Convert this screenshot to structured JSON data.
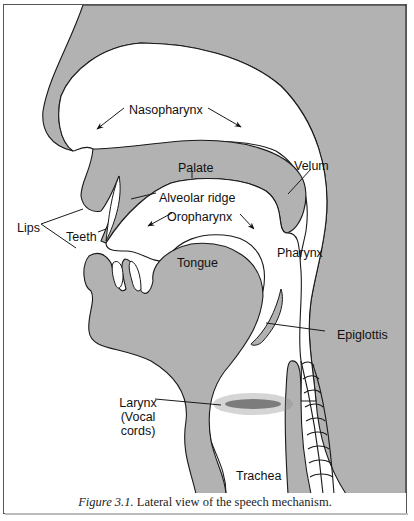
{
  "figure": {
    "caption_prefix": "Figure 3.1.",
    "caption_text": " Lateral view of the speech mechanism.",
    "fill_color": "#b2b2b2",
    "outline_color": "#1a1a1a"
  },
  "labels": {
    "nasopharynx": "Nasopharynx",
    "palate": "Palate",
    "velum": "Velum",
    "alveolar_ridge": "Alveolar ridge",
    "lips": "Lips",
    "teeth": "Teeth",
    "oropharynx": "Oropharynx",
    "pharynx": "Pharynx",
    "tongue": "Tongue",
    "epiglottis": "Epiglottis",
    "larynx_line1": "Larynx",
    "larynx_line2": "(Vocal",
    "larynx_line3": "cords)",
    "trachea": "Trachea"
  }
}
